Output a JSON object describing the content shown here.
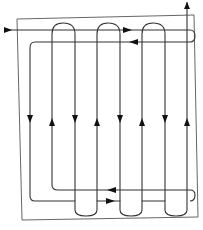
{
  "diagram": {
    "type": "serpentine-flow-layout",
    "colors": {
      "background": "#ffffff",
      "frame": "#555555",
      "line": "#333333",
      "arrow": "#111111"
    },
    "frame": {
      "x1": 17,
      "y1": 18,
      "x2": 198,
      "y2": 218
    },
    "inlet": {
      "label": "",
      "direction": "right",
      "y": 30
    },
    "outlet": {
      "label": "",
      "direction": "up",
      "x": 187
    },
    "vertical_runs": [
      {
        "x": 30,
        "direction": "down"
      },
      {
        "x": 52,
        "direction": "up"
      },
      {
        "x": 75,
        "direction": "down"
      },
      {
        "x": 97,
        "direction": "up"
      },
      {
        "x": 120,
        "direction": "down"
      },
      {
        "x": 142,
        "direction": "up"
      },
      {
        "x": 165,
        "direction": "down"
      },
      {
        "x": 187,
        "direction": "up"
      }
    ],
    "horizontal_arrows": [
      {
        "position": "top-upper",
        "direction": "right"
      },
      {
        "position": "top-lower",
        "direction": "left"
      },
      {
        "position": "bottom-upper",
        "direction": "left"
      },
      {
        "position": "bottom-lower",
        "direction": "right"
      }
    ]
  }
}
